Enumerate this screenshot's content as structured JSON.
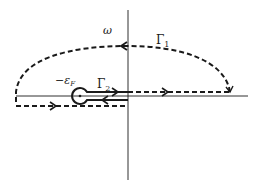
{
  "diagram": {
    "type": "complex-plane contour diagram",
    "labels": {
      "axis_variable": "ω",
      "contour_outer": "Γ",
      "contour_outer_sub": "1",
      "contour_inner": "Γ",
      "contour_inner_sub": "2",
      "pole_point": "−ε",
      "pole_point_sub": "F"
    },
    "colors": {
      "stroke": "#1a1a1a",
      "background": "#ffffff"
    }
  }
}
